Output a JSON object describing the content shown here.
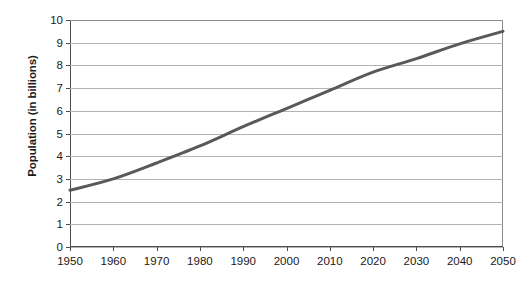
{
  "chart_data": {
    "type": "line",
    "title": "",
    "subtitle": "",
    "xlabel": "",
    "ylabel": "Population (in billions)",
    "x": [
      1950,
      1960,
      1970,
      1980,
      1990,
      2000,
      2010,
      2020,
      2030,
      2040,
      2050
    ],
    "xtick_labels": [
      "1950",
      "1960",
      "1970",
      "1980",
      "1990",
      "2000",
      "2010",
      "2020",
      "2030",
      "2040",
      "2050"
    ],
    "ytick_labels": [
      "0",
      "1",
      "2",
      "3",
      "4",
      "5",
      "6",
      "7",
      "8",
      "9",
      "10"
    ],
    "ytick_values": [
      0,
      1,
      2,
      3,
      4,
      5,
      6,
      7,
      8,
      9,
      10
    ],
    "xlim": [
      1950,
      2050
    ],
    "ylim": [
      0,
      10
    ],
    "grid": "horizontal",
    "legend": "none",
    "series": [
      {
        "name": "World population",
        "color": "#595959",
        "line_width": 3,
        "values": [
          2.5,
          3.0,
          3.7,
          4.45,
          5.3,
          6.1,
          6.9,
          7.7,
          8.3,
          8.95,
          9.5
        ]
      }
    ]
  },
  "axis": {
    "y_title": "Population (in billions)"
  },
  "colors": {
    "line": "#595959",
    "grid": "#b3b3b3",
    "axis": "#4d4d4d",
    "text": "#1a1a1a",
    "background": "#ffffff"
  }
}
